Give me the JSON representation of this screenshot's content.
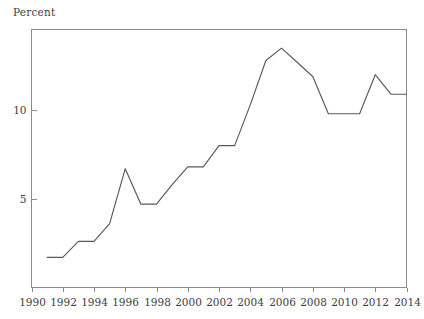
{
  "figure": {
    "axis_title": "Percent",
    "background_color": "#ffffff",
    "line_color": "#59595c",
    "frame_color": "#8a8a8a",
    "text_color": "#3d3d3d"
  },
  "chart_data": {
    "type": "line",
    "title": "",
    "subtitle": "",
    "xlabel": "",
    "ylabel": "Percent",
    "xlim": [
      1990,
      2014
    ],
    "ylim": [
      0.0,
      14.55
    ],
    "grid": false,
    "legend": null,
    "xticks": [
      1990,
      1992,
      1994,
      1996,
      1998,
      2000,
      2002,
      2004,
      2006,
      2008,
      2010,
      2012,
      2014
    ],
    "xticklabels": [
      "1990",
      "1992",
      "1994",
      "1996",
      "1998",
      "2000",
      "2002",
      "2004",
      "2006",
      "2008",
      "2010",
      "2012",
      "2014"
    ],
    "yticks": [
      5,
      10
    ],
    "yticklabels": [
      "5",
      "10"
    ],
    "x": [
      1991,
      1992,
      1993,
      1994,
      1995,
      1996,
      1997,
      1998,
      1999,
      2000,
      2001,
      2002,
      2003,
      2004,
      2005,
      2006,
      2007,
      2008,
      2009,
      2010,
      2011,
      2012,
      2013,
      2014
    ],
    "values": [
      1.7,
      1.7,
      2.6,
      2.6,
      3.6,
      6.7,
      4.7,
      4.7,
      5.8,
      6.8,
      6.8,
      8.0,
      8.0,
      10.3,
      12.8,
      13.5,
      12.7,
      11.9,
      9.8,
      9.8,
      9.8,
      12.0,
      10.9,
      10.9
    ],
    "series": [
      {
        "name": "Percent",
        "values": [
          1.7,
          1.7,
          2.6,
          2.6,
          3.6,
          6.7,
          4.7,
          4.7,
          5.8,
          6.8,
          6.8,
          8.0,
          8.0,
          10.3,
          12.8,
          13.5,
          12.7,
          11.9,
          9.8,
          9.8,
          9.8,
          12.0,
          10.9,
          10.9
        ]
      }
    ]
  }
}
